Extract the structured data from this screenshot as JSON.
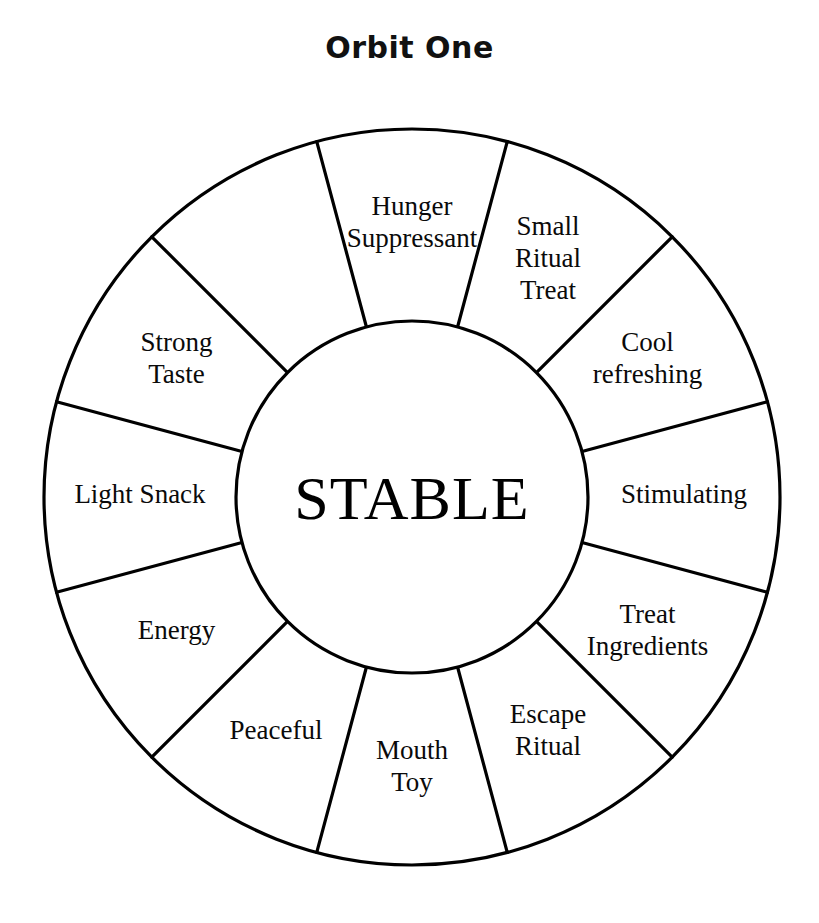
{
  "title": "Orbit One",
  "diagram": {
    "type": "radial-segmented-wheel",
    "hub_label": "STABLE",
    "segment_count": 12,
    "geometry": {
      "center_x": 412,
      "center_y": 497,
      "outer_radius": 368,
      "inner_radius": 176,
      "start_angle_deg": -15,
      "segment_span_deg": 30
    },
    "colors": {
      "stroke": "#000000",
      "fill": "#ffffff",
      "text": "#0a0a0a",
      "title": "#111111"
    },
    "segments": [
      {
        "id": "hunger-suppressant",
        "label": "Hunger Suppressant",
        "lines": [
          "Hunger",
          "Suppressant"
        ],
        "angle_deg": 0
      },
      {
        "id": "small-ritual-treat",
        "label": "Small Ritual Treat",
        "lines": [
          "Small",
          "Ritual",
          "Treat"
        ],
        "angle_deg": 30
      },
      {
        "id": "cool-refreshing",
        "label": "Cool refreshing",
        "lines": [
          "Cool",
          "refreshing"
        ],
        "angle_deg": 60
      },
      {
        "id": "stimulating",
        "label": "Stimulating",
        "lines": [
          "Stimulating"
        ],
        "angle_deg": 90
      },
      {
        "id": "treat-ingredients",
        "label": "Treat Ingredients",
        "lines": [
          "Treat",
          "Ingredients"
        ],
        "angle_deg": 120
      },
      {
        "id": "escape-ritual",
        "label": "Escape Ritual",
        "lines": [
          "Escape",
          "Ritual"
        ],
        "angle_deg": 150
      },
      {
        "id": "mouth-toy",
        "label": "Mouth Toy",
        "lines": [
          "Mouth",
          "Toy"
        ],
        "angle_deg": 180
      },
      {
        "id": "peaceful",
        "label": "Peaceful",
        "lines": [
          "Peaceful"
        ],
        "angle_deg": 210
      },
      {
        "id": "energy",
        "label": "Energy",
        "lines": [
          "Energy"
        ],
        "angle_deg": 240
      },
      {
        "id": "light-snack",
        "label": "Light Snack",
        "lines": [
          "Light Snack"
        ],
        "angle_deg": 270
      },
      {
        "id": "strong-taste",
        "label": "Strong Taste",
        "lines": [
          "Strong",
          "Taste"
        ],
        "angle_deg": 300
      },
      {
        "id": "hunger-suppressant-left",
        "label": "",
        "lines": [],
        "angle_deg": 330
      }
    ]
  }
}
